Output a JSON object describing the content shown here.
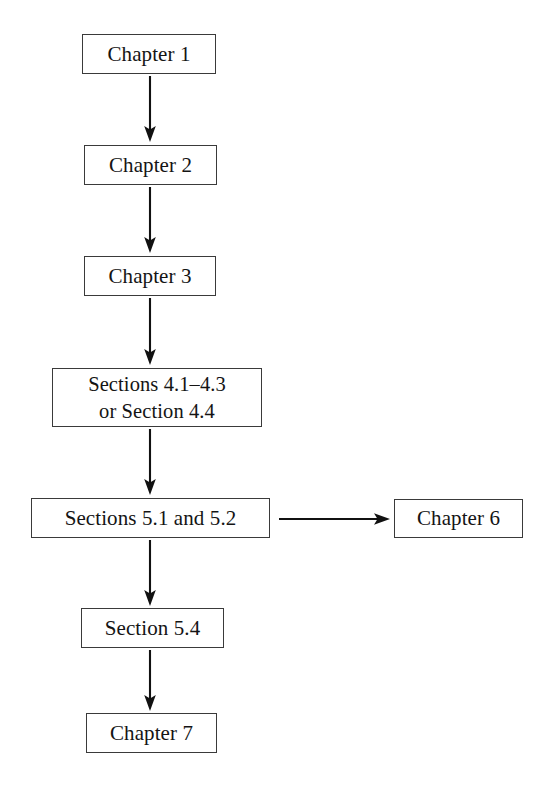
{
  "diagram": {
    "type": "flowchart",
    "background_color": "#ffffff",
    "box_border_color": "#3a3a3a",
    "text_color": "#141414",
    "arrow_color": "#111111",
    "nodes": [
      {
        "id": "chapter-1",
        "label": "Chapter 1",
        "x": 82,
        "y": 34,
        "w": 134,
        "h": 40,
        "lines": 1
      },
      {
        "id": "chapter-2",
        "label": "Chapter 2",
        "x": 84,
        "y": 145,
        "w": 133,
        "h": 40,
        "lines": 1
      },
      {
        "id": "chapter-3",
        "label": "Chapter 3",
        "x": 84,
        "y": 256,
        "w": 132,
        "h": 40,
        "lines": 1
      },
      {
        "id": "sections-4",
        "label": "Sections 4.1–4.3\nor Section 4.4",
        "x": 52,
        "y": 368,
        "w": 210,
        "h": 59,
        "lines": 2
      },
      {
        "id": "sections-5-1-and-5-2",
        "label": "Sections 5.1 and 5.2",
        "x": 31,
        "y": 498,
        "w": 239,
        "h": 40,
        "lines": 1
      },
      {
        "id": "chapter-6",
        "label": "Chapter 6",
        "x": 394,
        "y": 499,
        "w": 129,
        "h": 39,
        "lines": 1
      },
      {
        "id": "section-5-4",
        "label": "Section 5.4",
        "x": 81,
        "y": 608,
        "w": 143,
        "h": 40,
        "lines": 1
      },
      {
        "id": "chapter-7",
        "label": "Chapter 7",
        "x": 86,
        "y": 713,
        "w": 131,
        "h": 40,
        "lines": 1
      }
    ],
    "edges": [
      {
        "id": "edge-ch1-ch2",
        "from": "chapter-1",
        "to": "chapter-2",
        "direction": "down",
        "x1": 150,
        "y1": 76,
        "x2": 150,
        "y2": 142
      },
      {
        "id": "edge-ch2-ch3",
        "from": "chapter-2",
        "to": "chapter-3",
        "direction": "down",
        "x1": 150,
        "y1": 187,
        "x2": 150,
        "y2": 253
      },
      {
        "id": "edge-ch3-sec4",
        "from": "chapter-3",
        "to": "sections-4",
        "direction": "down",
        "x1": 150,
        "y1": 298,
        "x2": 150,
        "y2": 365
      },
      {
        "id": "edge-sec4-sec5",
        "from": "sections-4",
        "to": "sections-5-1-and-5-2",
        "direction": "down",
        "x1": 150,
        "y1": 429,
        "x2": 150,
        "y2": 495
      },
      {
        "id": "edge-sec5-ch6",
        "from": "sections-5-1-and-5-2",
        "to": "chapter-6",
        "direction": "right",
        "x1": 280,
        "y1": 519,
        "x2": 390,
        "y2": 519
      },
      {
        "id": "edge-sec5-sec54",
        "from": "sections-5-1-and-5-2",
        "to": "section-5-4",
        "direction": "down",
        "x1": 150,
        "y1": 540,
        "x2": 150,
        "y2": 605
      },
      {
        "id": "edge-sec54-ch7",
        "from": "section-5-4",
        "to": "chapter-7",
        "direction": "down",
        "x1": 150,
        "y1": 650,
        "x2": 150,
        "y2": 710
      }
    ]
  }
}
